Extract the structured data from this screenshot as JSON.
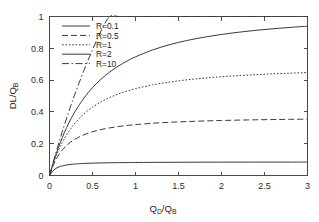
{
  "chart_data": {
    "type": "line",
    "title": "",
    "xlabel": "Q_D/Q_B",
    "ylabel": "DL/Q_B",
    "xlabel_main": "Q",
    "xlabel_sub1": "D",
    "xlabel_mid": "/Q",
    "xlabel_sub2": "B",
    "ylabel_main": "DL/Q",
    "ylabel_sub": "B",
    "xlim": [
      0,
      3
    ],
    "ylim": [
      0,
      1
    ],
    "grid": false,
    "legend_position": "top-left",
    "xticks": [
      "0",
      "0.5",
      "1",
      "1.5",
      "2",
      "2.5",
      "3"
    ],
    "xtick_values": [
      0,
      0.5,
      1,
      1.5,
      2,
      2.5,
      3
    ],
    "yticks": [
      "0",
      "0.2",
      "0.4",
      "0.6",
      "0.8",
      "1"
    ],
    "ytick_values": [
      0,
      0.2,
      0.4,
      0.6,
      0.8,
      1
    ],
    "x": [
      0,
      0.05,
      0.1,
      0.15,
      0.2,
      0.25,
      0.3,
      0.4,
      0.5,
      0.6,
      0.7,
      0.8,
      0.9,
      1.0,
      1.2,
      1.4,
      1.6,
      1.8,
      2.0,
      2.2,
      2.4,
      2.6,
      2.8,
      3.0
    ],
    "series": [
      {
        "name": "R=0.1",
        "label": "R=0.1",
        "style": "solid",
        "dash": "",
        "plateau": 0.088,
        "values": [
          0,
          0.0345,
          0.0518,
          0.0608,
          0.0662,
          0.0698,
          0.0724,
          0.0757,
          0.0778,
          0.0791,
          0.0801,
          0.0808,
          0.0814,
          0.0819,
          0.0826,
          0.0831,
          0.0835,
          0.0838,
          0.084,
          0.0842,
          0.0843,
          0.0844,
          0.0845,
          0.0846
        ]
      },
      {
        "name": "R=0.5",
        "label": "R=0.5",
        "style": "dashed",
        "dash": "6,3",
        "plateau": 0.365,
        "values": [
          0,
          0.0718,
          0.1232,
          0.1609,
          0.1895,
          0.2118,
          0.2296,
          0.2563,
          0.2751,
          0.2889,
          0.2995,
          0.3078,
          0.3145,
          0.3201,
          0.3286,
          0.3347,
          0.3394,
          0.343,
          0.3459,
          0.3483,
          0.3503,
          0.3519,
          0.3534,
          0.3546
        ]
      },
      {
        "name": "R=1",
        "label": "R=1",
        "style": "dotted",
        "dash": "1.6,1.8",
        "plateau": 0.582,
        "values": [
          0,
          0.0842,
          0.1525,
          0.2091,
          0.2566,
          0.2969,
          0.3314,
          0.3873,
          0.4301,
          0.4637,
          0.4906,
          0.5126,
          0.5308,
          0.5461,
          0.5703,
          0.5881,
          0.6018,
          0.6126,
          0.6212,
          0.6284,
          0.6344,
          0.6394,
          0.6437,
          0.6474
        ]
      },
      {
        "name": "R=2",
        "label": "R=2",
        "style": "solid",
        "dash": "",
        "plateau": 0.8,
        "values": [
          0,
          0.0912,
          0.1707,
          0.2405,
          0.3021,
          0.3566,
          0.4051,
          0.4869,
          0.5526,
          0.6062,
          0.6506,
          0.6878,
          0.7193,
          0.7463,
          0.7899,
          0.8232,
          0.8492,
          0.8701,
          0.8871,
          0.9012,
          0.913,
          0.923,
          0.9316,
          0.9391
        ]
      },
      {
        "name": "R=10",
        "label": "R=10",
        "style": "dash-dot",
        "dash": "7,2.5,1.5,2.5",
        "plateau": 1.0,
        "values": [
          0,
          0.0975,
          0.1902,
          0.2784,
          0.3623,
          0.4423,
          0.5185,
          0.6607,
          0.7906,
          0.9095,
          1.0,
          1.0,
          1.0,
          1.0,
          1.0,
          1.0,
          1.0,
          1.0,
          1.0,
          1.0,
          1.0,
          1.0,
          1.0,
          1.0
        ]
      }
    ],
    "colors": {
      "curve": "#3a3a3a",
      "axis": "#4a4a4a",
      "text": "#1c1c1c",
      "background": "#ffffff"
    }
  },
  "legend": {
    "entries": [
      {
        "label": "R=0.1"
      },
      {
        "label": "R=0.5"
      },
      {
        "label": "R=1"
      },
      {
        "label": "R=2"
      },
      {
        "label": "R=10"
      }
    ]
  }
}
